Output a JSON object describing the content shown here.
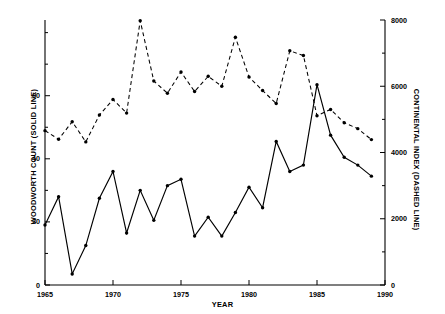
{
  "chart_data": {
    "type": "line",
    "title": "",
    "xlabel": "YEAR",
    "ylabel": "WOODWORTH COUNT (SOLID LINE)",
    "ylabel_right": "CONTINENTAL INDEX (DASHED LINE)",
    "xlim": [
      1965,
      1990
    ],
    "ylim": [
      0,
      84
    ],
    "ylim_right": [
      0,
      8000
    ],
    "xticks": [
      1965,
      1970,
      1975,
      1980,
      1985,
      1990
    ],
    "xtick_labels": [
      "1965",
      "1970",
      "1975",
      "1980",
      "1985",
      "1990"
    ],
    "yticks_left": [
      0,
      20,
      40,
      60
    ],
    "ytick_labels_left": [
      "0",
      "20",
      "40",
      "60"
    ],
    "yticks_right": [
      0,
      2000,
      4000,
      6000,
      8000
    ],
    "ytick_labels_right": [
      "0",
      "2000",
      "4000",
      "6000",
      "8000"
    ],
    "grid": false,
    "legend": "none",
    "marker": "filled-circle",
    "x": [
      1965,
      1966,
      1967,
      1968,
      1969,
      1970,
      1971,
      1972,
      1973,
      1974,
      1975,
      1976,
      1977,
      1978,
      1979,
      1980,
      1981,
      1982,
      1983,
      1984,
      1985,
      1986,
      1987,
      1988,
      1989
    ],
    "series": [
      {
        "name": "WOODWORTH COUNT (SOLID LINE)",
        "axis": "left",
        "style": "solid",
        "color": "#000000",
        "values": [
          19,
          28,
          3.5,
          12.5,
          27.5,
          36,
          16.5,
          30,
          20.5,
          31.5,
          33.5,
          15.5,
          21.5,
          15.5,
          23,
          31,
          24.5,
          45.5,
          36,
          38,
          63.5,
          47.5,
          40.5,
          38,
          34.5
        ]
      },
      {
        "name": "CONTINENTAL INDEX (DASHED LINE)",
        "axis": "right",
        "style": "dashed",
        "color": "#000000",
        "values": [
          4660,
          4400,
          4930,
          4320,
          5130,
          5600,
          5190,
          7980,
          6160,
          5790,
          6430,
          5840,
          6300,
          6000,
          7480,
          6280,
          5870,
          5480,
          7070,
          6930,
          5110,
          5300,
          4900,
          4720,
          4390
        ]
      }
    ]
  },
  "ticks": {
    "x": [
      "1965",
      "1970",
      "1975",
      "1980",
      "1985",
      "1990"
    ],
    "y_left": [
      "60",
      "40",
      "20",
      "0"
    ],
    "y_right": [
      "8000",
      "6000",
      "4000",
      "2000",
      "0"
    ]
  },
  "labels": {
    "x_axis": "YEAR",
    "y_axis_left": "WOODWORTH COUNT (SOLID LINE)",
    "y_axis_right": "CONTINENTAL INDEX (DASHED LINE)"
  }
}
